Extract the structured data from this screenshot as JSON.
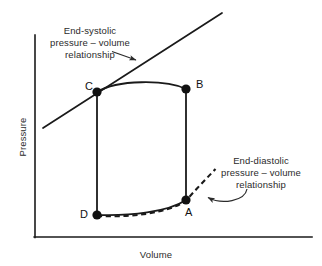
{
  "figure": {
    "type": "pressure-volume-loop-diagram",
    "background_color": "#ffffff",
    "line_color": "#1a1a1a",
    "text_color": "#2b2b2b"
  },
  "axes": {
    "x_title": "Volume",
    "y_title": "Pressure",
    "origin_px": [
      35,
      237
    ],
    "x_end_px": [
      312,
      237
    ],
    "y_top_px": [
      35,
      35
    ],
    "ticks": [],
    "grid": false
  },
  "annotations": {
    "espvr": {
      "line1": "End-systolic",
      "line2": "pressure – volume",
      "line3": "relationship",
      "arrow_from_px": [
        112,
        52
      ],
      "arrow_to_px": [
        139,
        61
      ]
    },
    "edpvr": {
      "line1": "End-diastolic",
      "line2": "pressure – volume",
      "line3": "relationship",
      "arrow_from_px": [
        246,
        190
      ],
      "arrow_to_px": [
        206,
        197
      ]
    }
  },
  "points": [
    {
      "id": "A",
      "label": "A",
      "x_px": 186,
      "y_px": 200,
      "label_x_px": 185,
      "label_y_px": 206,
      "description": "end-diastole / mitral valve closes"
    },
    {
      "id": "B",
      "label": "B",
      "x_px": 186,
      "y_px": 89,
      "label_x_px": 196,
      "label_y_px": 78,
      "description": "aortic valve opens"
    },
    {
      "id": "C",
      "label": "C",
      "x_px": 97,
      "y_px": 92,
      "label_x_px": 85,
      "label_y_px": 80,
      "description": "end-systole / aortic valve closes"
    },
    {
      "id": "D",
      "label": "D",
      "x_px": 97,
      "y_px": 215,
      "label_x_px": 80,
      "label_y_px": 208,
      "description": "mitral valve opens"
    }
  ],
  "curves": {
    "espvr_line": {
      "style": "solid",
      "from_px": [
        43,
        128
      ],
      "to_px": [
        222,
        13
      ]
    },
    "edpvr_dashed": {
      "style": "dashed",
      "path": "M 97 216 C 130 217 168 213 186 200 L 197 188 L 206 179 L 216 169"
    },
    "loop": {
      "style": "solid",
      "segments": [
        {
          "name": "isovolumic-contraction",
          "from": "A",
          "to": "B",
          "path": "M 186 200 L 186 89"
        },
        {
          "name": "ejection",
          "from": "B",
          "to": "C",
          "path": "M 186 89 C 165 80 118 80 97 92"
        },
        {
          "name": "isovolumic-relaxation",
          "from": "C",
          "to": "D",
          "path": "M 97 92 L 97 215"
        },
        {
          "name": "filling",
          "from": "D",
          "to": "A",
          "path": "M 97 215 C 130 216 168 212 186 200"
        }
      ]
    }
  }
}
